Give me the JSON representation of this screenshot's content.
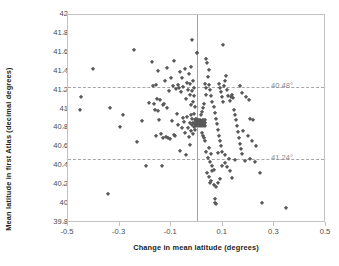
{
  "chart_data": {
    "type": "scatter",
    "title": "",
    "xlabel": "Change in mean latitude (degrees)",
    "ylabel": "Mean latitude in first Atlas (decimal degrees)",
    "xlim": [
      -0.5,
      0.5
    ],
    "ylim": [
      39.8,
      42.0
    ],
    "xticks": [
      "-0.5",
      "-0.3",
      "-0.1",
      "0.1",
      "0.3",
      "0.5"
    ],
    "xtick_values": [
      -0.5,
      -0.3,
      -0.1,
      0.1,
      0.3,
      0.5
    ],
    "yticks": [
      "42",
      "41.8",
      "41.6",
      "41.4",
      "41.2",
      "41",
      "40.8",
      "40.6",
      "40.4",
      "40.2",
      "40",
      "39.8"
    ],
    "ytick_values": [
      42.0,
      41.8,
      41.6,
      41.4,
      41.2,
      41.0,
      40.8,
      40.6,
      40.4,
      40.2,
      40.0,
      39.8
    ],
    "grid": false,
    "legend": "none",
    "marker": "diamond",
    "marker_color": "#595959",
    "frame_color": "#c2c2c2",
    "reference_lines": [
      {
        "name": "upper-dashed-line",
        "orientation": "horizontal",
        "y": 41.24,
        "label": "40.48°",
        "style": "dashed",
        "color": "#a6a6a6"
      },
      {
        "name": "lower-dashed-line",
        "orientation": "horizontal",
        "y": 40.48,
        "label": "41.24°",
        "style": "dashed",
        "color": "#a6a6a6"
      },
      {
        "name": "zero-vertical-line",
        "orientation": "vertical",
        "x": 0.0,
        "label": "",
        "style": "solid",
        "color": "#a2a2a2"
      }
    ],
    "points": [
      [
        -0.455,
        41.0
      ],
      [
        -0.448,
        41.135
      ],
      [
        -0.402,
        41.425
      ],
      [
        -0.345,
        40.105
      ],
      [
        -0.337,
        41.015
      ],
      [
        -0.288,
        40.945
      ],
      [
        -0.297,
        40.815
      ],
      [
        -0.243,
        41.635
      ],
      [
        -0.232,
        40.655
      ],
      [
        -0.215,
        40.875
      ],
      [
        -0.198,
        40.405
      ],
      [
        -0.186,
        41.07
      ],
      [
        -0.176,
        41.505
      ],
      [
        -0.172,
        41.245
      ],
      [
        -0.168,
        41.06
      ],
      [
        -0.163,
        40.99
      ],
      [
        -0.16,
        41.255
      ],
      [
        -0.158,
        40.72
      ],
      [
        -0.155,
        41.115
      ],
      [
        -0.152,
        40.98
      ],
      [
        -0.15,
        41.41
      ],
      [
        -0.147,
        40.885
      ],
      [
        -0.144,
        41.1
      ],
      [
        -0.14,
        40.74
      ],
      [
        -0.137,
        40.405
      ],
      [
        -0.133,
        41.045
      ],
      [
        -0.13,
        40.695
      ],
      [
        -0.127,
        41.055
      ],
      [
        -0.124,
        41.3
      ],
      [
        -0.121,
        40.71
      ],
      [
        -0.118,
        41.435
      ],
      [
        -0.115,
        41.02
      ],
      [
        -0.112,
        40.7
      ],
      [
        -0.108,
        41.2
      ],
      [
        -0.104,
        40.685
      ],
      [
        -0.1,
        41.335
      ],
      [
        -0.097,
        40.875
      ],
      [
        -0.094,
        41.245
      ],
      [
        -0.091,
        40.73
      ],
      [
        -0.088,
        41.515
      ],
      [
        -0.085,
        40.72
      ],
      [
        -0.082,
        41.215
      ],
      [
        -0.078,
        40.955
      ],
      [
        -0.075,
        41.26
      ],
      [
        -0.072,
        40.84
      ],
      [
        -0.069,
        41.225
      ],
      [
        -0.066,
        41.395
      ],
      [
        -0.064,
        40.565
      ],
      [
        -0.062,
        41.185
      ],
      [
        -0.06,
        40.8
      ],
      [
        -0.057,
        41.33
      ],
      [
        -0.055,
        40.915
      ],
      [
        -0.053,
        41.235
      ],
      [
        -0.05,
        40.865
      ],
      [
        -0.048,
        41.43
      ],
      [
        -0.046,
        40.755
      ],
      [
        -0.044,
        41.115
      ],
      [
        -0.042,
        40.52
      ],
      [
        -0.04,
        41.285
      ],
      [
        -0.038,
        40.925
      ],
      [
        -0.036,
        41.205
      ],
      [
        -0.034,
        40.805
      ],
      [
        -0.032,
        41.375
      ],
      [
        -0.03,
        40.705
      ],
      [
        -0.029,
        41.155
      ],
      [
        -0.028,
        40.86
      ],
      [
        -0.027,
        41.265
      ],
      [
        -0.026,
        40.625
      ],
      [
        -0.025,
        41.045
      ],
      [
        -0.024,
        40.945
      ],
      [
        -0.023,
        41.455
      ],
      [
        -0.022,
        40.775
      ],
      [
        -0.021,
        41.195
      ],
      [
        -0.02,
        40.835
      ],
      [
        -0.019,
        41.74
      ],
      [
        -0.018,
        40.895
      ],
      [
        -0.017,
        41.305
      ],
      [
        -0.016,
        40.745
      ],
      [
        -0.015,
        41.085
      ],
      [
        -0.014,
        40.855
      ],
      [
        -0.013,
        41.225
      ],
      [
        -0.012,
        40.815
      ],
      [
        -0.011,
        40.955
      ],
      [
        -0.01,
        41.145
      ],
      [
        -0.009,
        40.885
      ],
      [
        -0.008,
        40.785
      ],
      [
        -0.007,
        41.025
      ],
      [
        -0.006,
        40.845
      ],
      [
        -0.005,
        40.905
      ],
      [
        -0.004,
        40.825
      ],
      [
        -0.003,
        40.865
      ],
      [
        -0.002,
        40.885
      ],
      [
        -0.001,
        40.855
      ],
      [
        0.0,
        41.595
      ],
      [
        0.0,
        41.6
      ],
      [
        0.0,
        40.875
      ],
      [
        0.001,
        40.845
      ],
      [
        0.002,
        40.865
      ],
      [
        0.003,
        40.885
      ],
      [
        0.004,
        40.835
      ],
      [
        0.005,
        40.855
      ],
      [
        0.006,
        40.825
      ],
      [
        0.007,
        40.845
      ],
      [
        0.008,
        40.875
      ],
      [
        0.009,
        40.865
      ],
      [
        0.01,
        40.835
      ],
      [
        0.011,
        40.855
      ],
      [
        0.012,
        40.885
      ],
      [
        0.013,
        40.845
      ],
      [
        0.014,
        40.865
      ],
      [
        0.015,
        40.825
      ],
      [
        0.016,
        40.855
      ],
      [
        0.017,
        40.875
      ],
      [
        0.018,
        40.845
      ],
      [
        0.019,
        40.835
      ],
      [
        0.02,
        40.865
      ],
      [
        0.021,
        40.855
      ],
      [
        0.022,
        40.885
      ],
      [
        0.023,
        40.825
      ],
      [
        0.024,
        40.845
      ],
      [
        0.025,
        40.875
      ],
      [
        0.026,
        40.835
      ],
      [
        0.027,
        40.855
      ],
      [
        0.028,
        40.865
      ],
      [
        0.029,
        40.845
      ],
      [
        0.03,
        40.825
      ],
      [
        0.031,
        40.885
      ],
      [
        0.032,
        40.855
      ],
      [
        0.018,
        40.755
      ],
      [
        0.022,
        40.725
      ],
      [
        0.026,
        40.695
      ],
      [
        0.03,
        40.665
      ],
      [
        0.015,
        40.945
      ],
      [
        0.019,
        40.975
      ],
      [
        0.023,
        41.015
      ],
      [
        0.027,
        41.055
      ],
      [
        0.033,
        41.155
      ],
      [
        0.036,
        41.225
      ],
      [
        0.03,
        41.275
      ],
      [
        0.042,
        41.34
      ],
      [
        0.046,
        41.415
      ],
      [
        0.038,
        41.495
      ],
      [
        0.034,
        41.535
      ],
      [
        0.048,
        41.255
      ],
      [
        0.052,
        41.205
      ],
      [
        0.056,
        41.145
      ],
      [
        0.06,
        41.085
      ],
      [
        0.064,
        41.025
      ],
      [
        0.068,
        40.965
      ],
      [
        0.072,
        40.905
      ],
      [
        0.076,
        40.845
      ],
      [
        0.08,
        40.785
      ],
      [
        0.084,
        40.725
      ],
      [
        0.088,
        40.665
      ],
      [
        0.092,
        40.615
      ],
      [
        0.096,
        40.555
      ],
      [
        0.1,
        41.685
      ],
      [
        0.085,
        41.265
      ],
      [
        0.09,
        41.225
      ],
      [
        0.094,
        41.185
      ],
      [
        0.098,
        41.135
      ],
      [
        0.102,
        41.085
      ],
      [
        0.106,
        41.245
      ],
      [
        0.11,
        41.3
      ],
      [
        0.114,
        41.355
      ],
      [
        0.118,
        41.205
      ],
      [
        0.122,
        41.145
      ],
      [
        0.126,
        41.095
      ],
      [
        0.13,
        41.135
      ],
      [
        0.134,
        41.155
      ],
      [
        0.138,
        41.125
      ],
      [
        0.142,
        41.0
      ],
      [
        0.146,
        40.945
      ],
      [
        0.15,
        40.885
      ],
      [
        0.154,
        40.825
      ],
      [
        0.158,
        40.765
      ],
      [
        0.162,
        40.695
      ],
      [
        0.166,
        40.635
      ],
      [
        0.17,
        40.585
      ],
      [
        0.174,
        40.535
      ],
      [
        0.042,
        40.485
      ],
      [
        0.05,
        40.445
      ],
      [
        0.058,
        40.405
      ],
      [
        0.066,
        40.365
      ],
      [
        0.04,
        40.325
      ],
      [
        0.048,
        40.285
      ],
      [
        0.056,
        40.245
      ],
      [
        0.064,
        40.205
      ],
      [
        0.072,
        40.185
      ],
      [
        0.08,
        40.225
      ],
      [
        0.088,
        40.265
      ],
      [
        0.07,
        40.015
      ],
      [
        0.074,
        40.0
      ],
      [
        0.068,
        40.055
      ],
      [
        0.125,
        40.475
      ],
      [
        0.148,
        40.465
      ],
      [
        0.185,
        40.455
      ],
      [
        0.205,
        40.475
      ],
      [
        0.225,
        40.445
      ],
      [
        0.245,
        40.325
      ],
      [
        0.25,
        40.015
      ],
      [
        0.345,
        39.955
      ],
      [
        0.23,
        40.615
      ],
      [
        0.212,
        40.665
      ],
      [
        0.196,
        40.715
      ],
      [
        0.18,
        40.775
      ],
      [
        0.205,
        40.895
      ],
      [
        0.218,
        40.885
      ],
      [
        0.2,
        41.105
      ],
      [
        0.188,
        41.135
      ],
      [
        0.176,
        41.175
      ],
      [
        0.165,
        41.25
      ],
      [
        0.11,
        40.435
      ],
      [
        0.118,
        40.395
      ],
      [
        0.126,
        40.355
      ],
      [
        0.134,
        40.275
      ],
      [
        0.095,
        40.405
      ],
      [
        0.045,
        40.595
      ],
      [
        0.035,
        40.555
      ],
      [
        0.055,
        40.525
      ],
      [
        0.108,
        40.515
      ],
      [
        0.082,
        40.545
      ],
      [
        0.06,
        40.345
      ],
      [
        0.052,
        40.225
      ]
    ]
  },
  "axes": {
    "x_title": "Change in mean latitude (degrees)",
    "y_title": "Mean latitude in first Atlas (decimal degrees)"
  }
}
